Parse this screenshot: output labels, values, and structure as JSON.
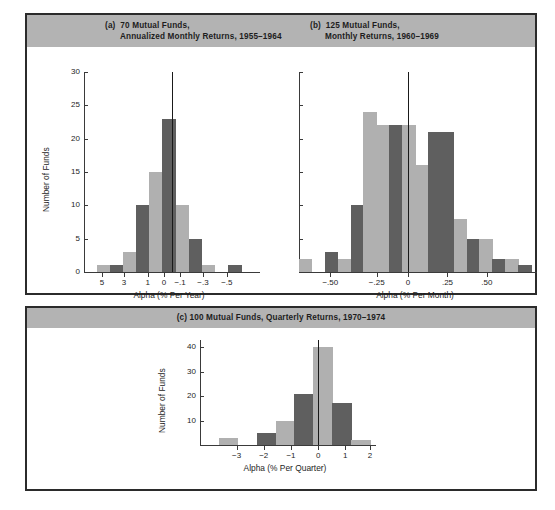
{
  "figure": {
    "background": "#ffffff",
    "frame_color": "#2b2b2b",
    "titlebar_color": "#b3b3b3",
    "bar_light": "#b0b0b0",
    "bar_dark": "#5f5f5f"
  },
  "panels": {
    "a": {
      "tag": "(a)",
      "title_line1": "70 Mutual Funds,",
      "title_line2": "Annualized Monthly Returns, 1955–1964"
    },
    "b": {
      "tag": "(b)",
      "title_line1": "125 Mutual Funds,",
      "title_line2": "Monthly Returns, 1960–1969"
    },
    "c": {
      "tag": "(c)",
      "title": "(c) 100 Mutual Funds, Quarterly Returns, 1970–1974"
    }
  },
  "chart_data": [
    {
      "id": "a",
      "type": "bar",
      "title": "(a) 70 Mutual Funds, Annualized Monthly Returns, 1955–1964",
      "xlabel": "Alpha (% Per Year)",
      "ylabel": "Number of Funds",
      "ylim": [
        0,
        30
      ],
      "yticks": [
        0,
        5,
        10,
        15,
        20,
        25,
        30
      ],
      "ytick_labels": [
        "0",
        "5",
        "10",
        "15",
        "20",
        "25",
        "30"
      ],
      "xtick_labels": [
        "5",
        "3",
        "1",
        "0",
        "−.1",
        "−.3",
        "−.5"
      ],
      "xtick_positions": [
        0.105,
        0.235,
        0.375,
        0.47,
        0.565,
        0.7,
        0.84
      ],
      "grid": false,
      "legend": "none",
      "zero_line_at": 0.515,
      "n_bins": 13,
      "categories": [
        "5+",
        "5",
        "4",
        "3",
        "2",
        "1",
        "0.5",
        "0",
        "-0.1",
        "-0.2",
        "-0.3",
        "-0.4",
        "-0.5"
      ],
      "values": [
        0,
        1,
        1,
        3,
        10,
        15,
        23,
        10,
        5,
        1,
        0,
        1,
        0
      ],
      "bar_shades": [
        "light",
        "light",
        "dark",
        "light",
        "dark",
        "light",
        "dark",
        "light",
        "dark",
        "light",
        "light",
        "dark",
        "light"
      ]
    },
    {
      "id": "b",
      "type": "bar",
      "title": "(b) 125 Mutual Funds, Monthly Returns, 1960–1969",
      "xlabel": "Alpha (% Per Month)",
      "ylabel": "",
      "ylim": [
        0,
        30
      ],
      "yticks": [
        0,
        5,
        10,
        15,
        20,
        25,
        30
      ],
      "ytick_labels": [
        "",
        "",
        "",
        "",
        "",
        "",
        ""
      ],
      "xtick_labels": [
        "−.50",
        "−.25",
        "0",
        ".25",
        ".50"
      ],
      "xtick_positions": [
        0.135,
        0.335,
        0.47,
        0.64,
        0.81
      ],
      "grid": false,
      "legend": "none",
      "zero_line_at": 0.47,
      "n_bins": 18,
      "categories": [
        "-0.60",
        "-0.55",
        "-0.45",
        "-0.40",
        "-0.30",
        "-0.25",
        "-0.15",
        "-0.10",
        "-0.05",
        "0.05",
        "0.10",
        "0.15",
        "0.20",
        "0.25",
        "0.30",
        "0.40",
        "0.55",
        "0.65"
      ],
      "values": [
        2,
        0,
        3,
        2,
        10,
        24,
        22,
        22,
        22,
        16,
        21,
        21,
        8,
        5,
        5,
        2,
        2,
        1
      ],
      "bar_shades": [
        "light",
        "light",
        "dark",
        "light",
        "dark",
        "light",
        "light",
        "dark",
        "light",
        "light",
        "dark",
        "dark",
        "light",
        "dark",
        "light",
        "dark",
        "light",
        "dark"
      ]
    },
    {
      "id": "c",
      "type": "bar",
      "title": "(c) 100 Mutual Funds, Quarterly Returns, 1970–1974",
      "xlabel": "Alpha (% Per Quarter)",
      "ylabel": "Number of Funds",
      "ylim": [
        0,
        43
      ],
      "yticks": [
        10,
        20,
        30,
        40
      ],
      "ytick_labels": [
        "10",
        "20",
        "30",
        "40"
      ],
      "xtick_labels": [
        "−3",
        "−2",
        "−1",
        "0",
        "1",
        "2"
      ],
      "xtick_positions": [
        0.215,
        0.375,
        0.535,
        0.695,
        0.855,
        1.0
      ],
      "grid": false,
      "legend": "none",
      "zero_line_at": 0.695,
      "n_bins": 9,
      "categories": [
        "-3.0",
        "-2.5",
        "-2.0",
        "-1.5",
        "-1.0",
        "-0.5",
        "0",
        "0.5",
        "1.0"
      ],
      "values": [
        0,
        3,
        0,
        5,
        10,
        21,
        40,
        17,
        2
      ],
      "bar_shades": [
        "light",
        "light",
        "light",
        "dark",
        "light",
        "dark",
        "light",
        "dark",
        "light"
      ]
    }
  ]
}
